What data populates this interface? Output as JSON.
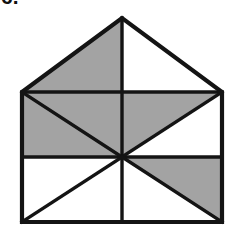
{
  "page": {
    "width": 244,
    "height": 234,
    "background_color": "#ffffff"
  },
  "question_number": {
    "text": "6.",
    "note": "bold numeral cropped at the top edge of the image"
  },
  "figure": {
    "stroke_color": "#141414",
    "fill_shaded": "#a3a3a3",
    "fill_plain": "#ffffff",
    "stroke_width_outer": 4,
    "stroke_width_inner": 3,
    "points": {
      "apex": [
        122,
        18
      ],
      "eave_left": [
        22,
        92
      ],
      "eave_right": [
        222,
        92
      ],
      "eave_mid": [
        122,
        92
      ],
      "mid_left": [
        22,
        157
      ],
      "mid_right": [
        222,
        157
      ],
      "centre": [
        122,
        157
      ],
      "base_left": [
        22,
        222
      ],
      "base_right": [
        222,
        222
      ],
      "base_mid": [
        122,
        222
      ]
    },
    "regions": [
      {
        "name": "roof-left",
        "shaded": true,
        "vertices": "122,18 22,92 122,92"
      },
      {
        "name": "roof-right",
        "shaded": false,
        "vertices": "122,18 222,92 122,92"
      },
      {
        "name": "upper-left-upper-triangle",
        "shaded": true,
        "vertices": "22,92 122,92 122,157"
      },
      {
        "name": "upper-left-lower-triangle",
        "shaded": true,
        "vertices": "22,92 122,157 22,157"
      },
      {
        "name": "upper-right-upper-triangle",
        "shaded": true,
        "vertices": "122,92 222,92 122,157"
      },
      {
        "name": "upper-right-lower-triangle",
        "shaded": false,
        "vertices": "222,92 222,157 122,157"
      },
      {
        "name": "lower-left-upper-triangle",
        "shaded": false,
        "vertices": "22,157 122,157 22,222"
      },
      {
        "name": "lower-left-lower-triangle",
        "shaded": false,
        "vertices": "122,157 122,222 22,222"
      },
      {
        "name": "lower-right-upper-triangle",
        "shaded": true,
        "vertices": "122,157 222,157 222,222"
      },
      {
        "name": "lower-right-lower-triangle",
        "shaded": false,
        "vertices": "122,157 222,222 122,222"
      }
    ],
    "lines": [
      {
        "name": "outline-pentagon",
        "path": "M22,92 L122,18 L222,92 L222,222 L22,222 Z"
      },
      {
        "name": "eaves-line",
        "path": "M22,92 L222,92"
      },
      {
        "name": "mid-horizontal-line",
        "path": "M22,157 L222,157"
      },
      {
        "name": "vertical-centre-line",
        "path": "M122,18 L122,222"
      },
      {
        "name": "diagonal-centre-to-eave-left",
        "path": "M122,157 L22,92"
      },
      {
        "name": "diagonal-centre-to-eave-right",
        "path": "M122,157 L222,92"
      },
      {
        "name": "diagonal-centre-to-base-left",
        "path": "M122,157 L22,222"
      },
      {
        "name": "diagonal-centre-to-base-right",
        "path": "M122,157 L222,222"
      }
    ],
    "counts": {
      "shaded_regions": 5,
      "unshaded_regions": 5,
      "total_regions": 10
    }
  }
}
